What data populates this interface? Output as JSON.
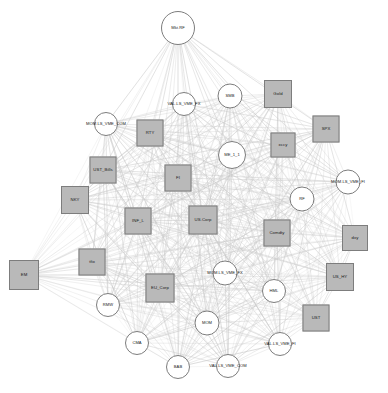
{
  "figure": {
    "type": "network-graph",
    "title": "",
    "background_color": "#ffffff",
    "edge_color": "#c9c9c9",
    "square_fill": "#b9b9b9",
    "circle_fill": "#ffffff",
    "node_stroke": "#7d7d7d",
    "label_color": "#1a1a1a",
    "node_count": 32,
    "square_node_count": 17,
    "circle_node_count": 15
  },
  "nodes": [
    {
      "id": "Mkt.RF",
      "label": "Mkt.RF",
      "shape": "circle",
      "x": 178,
      "y": 28,
      "size": 34
    },
    {
      "id": "VAL.LS_VME_FX",
      "label": "VAL.LS_VME_FX",
      "shape": "circle",
      "x": 184,
      "y": 104,
      "size": 24
    },
    {
      "id": "SMB",
      "label": "SMB",
      "shape": "circle",
      "x": 230,
      "y": 96,
      "size": 25
    },
    {
      "id": "Gold",
      "label": "Gold",
      "shape": "square",
      "x": 278,
      "y": 94,
      "size": 28
    },
    {
      "id": "MOM.LS_VME_COM",
      "label": "MOM.LS_VME_COM",
      "shape": "circle",
      "x": 106,
      "y": 124,
      "size": 24
    },
    {
      "id": "RTY",
      "label": "RTY",
      "shape": "square",
      "x": 150,
      "y": 133,
      "size": 27
    },
    {
      "id": "SPX",
      "label": "SPX",
      "shape": "square",
      "x": 326,
      "y": 129,
      "size": 27
    },
    {
      "id": "xccy",
      "label": "xccy",
      "shape": "square",
      "x": 283,
      "y": 145,
      "size": 25
    },
    {
      "id": "ME_1_1",
      "label": "ME_1_1",
      "shape": "circle",
      "x": 232,
      "y": 155,
      "size": 28
    },
    {
      "id": "UST_Bills",
      "label": "UST_Bills",
      "shape": "square",
      "x": 103,
      "y": 170,
      "size": 27
    },
    {
      "id": "FI",
      "label": "FI",
      "shape": "square",
      "x": 178,
      "y": 178,
      "size": 27
    },
    {
      "id": "MOM.LS_VME_FI",
      "label": "MOM.LS_VME_FI",
      "shape": "circle",
      "x": 348,
      "y": 182,
      "size": 25
    },
    {
      "id": "NKY",
      "label": "NKY",
      "shape": "square",
      "x": 75,
      "y": 200,
      "size": 28
    },
    {
      "id": "RF",
      "label": "RF",
      "shape": "circle",
      "x": 302,
      "y": 199,
      "size": 25
    },
    {
      "id": "INF_L",
      "label": "INF_L",
      "shape": "square",
      "x": 138,
      "y": 221,
      "size": 27
    },
    {
      "id": "US.Corp",
      "label": "US.Corp",
      "shape": "square",
      "x": 203,
      "y": 220,
      "size": 29
    },
    {
      "id": "Comdty",
      "label": "Comdty",
      "shape": "square",
      "x": 277,
      "y": 233,
      "size": 27
    },
    {
      "id": "dxy",
      "label": "dxy",
      "shape": "square",
      "x": 355,
      "y": 238,
      "size": 26
    },
    {
      "id": "tfix",
      "label": "tfix",
      "shape": "square",
      "x": 92,
      "y": 262,
      "size": 27
    },
    {
      "id": "EM",
      "label": "EM",
      "shape": "square",
      "x": 24,
      "y": 275,
      "size": 30
    },
    {
      "id": "MOM.LS_VME_FX",
      "label": "MOM.LS_VME_FX",
      "shape": "circle",
      "x": 225,
      "y": 273,
      "size": 25
    },
    {
      "id": "US_HY",
      "label": "US_HY",
      "shape": "square",
      "x": 340,
      "y": 277,
      "size": 28
    },
    {
      "id": "EU_Corp",
      "label": "EU_Corp",
      "shape": "square",
      "x": 160,
      "y": 288,
      "size": 29
    },
    {
      "id": "HML",
      "label": "HML",
      "shape": "circle",
      "x": 274,
      "y": 291,
      "size": 24
    },
    {
      "id": "RMW",
      "label": "RMW",
      "shape": "circle",
      "x": 108,
      "y": 305,
      "size": 24
    },
    {
      "id": "UST",
      "label": "UST",
      "shape": "square",
      "x": 316,
      "y": 318,
      "size": 27
    },
    {
      "id": "MOM",
      "label": "MOM",
      "shape": "circle",
      "x": 207,
      "y": 323,
      "size": 25
    },
    {
      "id": "CMA",
      "label": "CMA",
      "shape": "circle",
      "x": 137,
      "y": 343,
      "size": 24
    },
    {
      "id": "VAL.LS_VME_FI",
      "label": "VAL.LS_VME_FI",
      "shape": "circle",
      "x": 280,
      "y": 344,
      "size": 24
    },
    {
      "id": "BAB",
      "label": "BAB",
      "shape": "circle",
      "x": 178,
      "y": 367,
      "size": 24
    },
    {
      "id": "VAL.LS_VME_COM",
      "label": "VAL.LS_VME_COM",
      "shape": "circle",
      "x": 228,
      "y": 366,
      "size": 24
    }
  ],
  "edges_note": "dense near-complete light gray weighted network between all nodes"
}
